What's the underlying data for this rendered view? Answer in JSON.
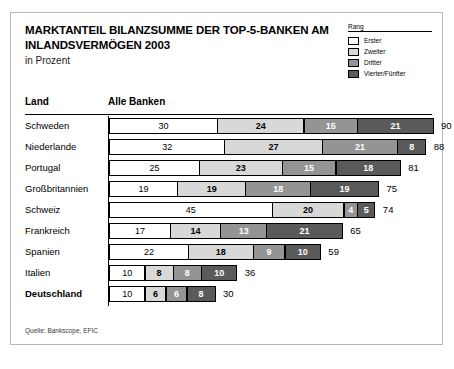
{
  "figure": {
    "title_lines": [
      "MARKTANTEIL BILANZSUMME DER TOP-5-BANKEN AM",
      "INLANDSVERMÖGEN 2003"
    ],
    "subtitle": "in Prozent",
    "source": "Quelle: Bankscope, EFIC",
    "columns": {
      "country": "Land",
      "value": "Alle Banken"
    },
    "legend": {
      "title": "Rang",
      "items": [
        {
          "label": "Erster",
          "color": "#ffffff"
        },
        {
          "label": "Zweiter",
          "color": "#d8d8d8"
        },
        {
          "label": "Dritter",
          "color": "#949494"
        },
        {
          "label": "Vierter/Fünfter",
          "color": "#5a5a5a"
        }
      ]
    }
  },
  "chart_data": {
    "type": "bar",
    "orientation": "horizontal",
    "stacked": true,
    "title": "MARKTANTEIL BILANZSUMME DER TOP-5-BANKEN AM INLANDSVERMÖGEN 2003",
    "subtitle": "in Prozent",
    "xlabel": "Alle Banken",
    "ylabel": "Land",
    "unit": "Prozent",
    "grid": false,
    "legend_position": "top-right",
    "xlim": [
      0,
      90
    ],
    "categories": [
      "Schweden",
      "Niederlande",
      "Portugal",
      "Großbritannien",
      "Schweiz",
      "Frankreich",
      "Spanien",
      "Italien",
      "Deutschland"
    ],
    "series": [
      {
        "name": "Erster",
        "color": "#ffffff",
        "values": [
          30,
          32,
          25,
          19,
          45,
          17,
          22,
          10,
          10
        ]
      },
      {
        "name": "Zweiter",
        "color": "#d8d8d8",
        "values": [
          24,
          27,
          23,
          19,
          20,
          14,
          18,
          8,
          6
        ]
      },
      {
        "name": "Dritter",
        "color": "#949494",
        "values": [
          15,
          21,
          15,
          18,
          4,
          13,
          9,
          8,
          6
        ]
      },
      {
        "name": "Vierter/Fünfter",
        "color": "#5a5a5a",
        "values": [
          21,
          8,
          18,
          19,
          5,
          21,
          10,
          10,
          8
        ]
      }
    ],
    "totals": [
      90,
      88,
      81,
      75,
      74,
      65,
      59,
      36,
      30
    ],
    "emphasized_category": "Deutschland",
    "rows": [
      {
        "country": "Schweden",
        "segments": [
          30,
          24,
          15,
          21
        ],
        "total": 90,
        "bold": false
      },
      {
        "country": "Niederlande",
        "segments": [
          32,
          27,
          21,
          8
        ],
        "total": 88,
        "bold": false
      },
      {
        "country": "Portugal",
        "segments": [
          25,
          23,
          15,
          18
        ],
        "total": 81,
        "bold": false
      },
      {
        "country": "Großbritannien",
        "segments": [
          19,
          19,
          18,
          19
        ],
        "total": 75,
        "bold": false
      },
      {
        "country": "Schweiz",
        "segments": [
          45,
          20,
          4,
          5
        ],
        "total": 74,
        "bold": false
      },
      {
        "country": "Frankreich",
        "segments": [
          17,
          14,
          13,
          21
        ],
        "total": 65,
        "bold": false
      },
      {
        "country": "Spanien",
        "segments": [
          22,
          18,
          9,
          10
        ],
        "total": 59,
        "bold": false
      },
      {
        "country": "Italien",
        "segments": [
          10,
          8,
          8,
          10
        ],
        "total": 36,
        "bold": false
      },
      {
        "country": "Deutschland",
        "segments": [
          10,
          6,
          6,
          8
        ],
        "total": 30,
        "bold": true
      }
    ]
  }
}
